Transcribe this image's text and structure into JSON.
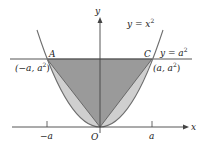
{
  "figure": {
    "type": "parabola-triangle-diagram",
    "curve_label": "y = x",
    "curve_label_exp": "2",
    "line_label": "y = a",
    "line_label_exp": "2",
    "axis_x_label": "x",
    "axis_y_label": "y",
    "origin_label": "O",
    "point_A": {
      "name": "A",
      "coord_prefix": "(−a, a",
      "coord_exp": "2",
      "coord_suffix": ")"
    },
    "point_C": {
      "name": "C",
      "coord_prefix": "(a, a",
      "coord_exp": "2",
      "coord_suffix": ")"
    },
    "tick_neg": "−a",
    "tick_pos": "a",
    "colors": {
      "triangle_fill": "#9a9a9a",
      "segment_fill": "#cfcfcf",
      "curve_stroke": "#6e6e6e",
      "line_stroke": "#555555",
      "axis_stroke": "#444444"
    }
  }
}
